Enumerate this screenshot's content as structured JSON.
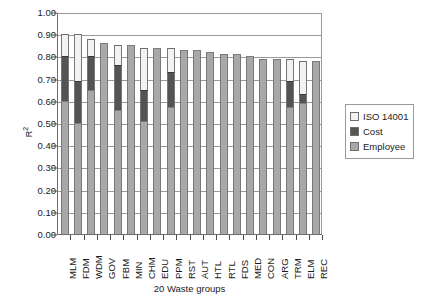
{
  "chart_data": {
    "type": "bar",
    "subtype": "stacked",
    "title": "",
    "xlabel": "20 Waste groups",
    "ylabel": "R²",
    "ylim": [
      0.0,
      1.0
    ],
    "ytick_step": 0.1,
    "grid": true,
    "legend_position": "right",
    "ytick_labels": [
      "1.00",
      "0.90",
      "0.80",
      "0.70",
      "0.60",
      "0.50",
      "0.40",
      "0.30",
      "0.20",
      "0.10",
      "0.00"
    ],
    "ytick_values": [
      1.0,
      0.9,
      0.8,
      0.7,
      0.6,
      0.5,
      0.4,
      0.3,
      0.2,
      0.1,
      0.0
    ],
    "categories": [
      "MLM",
      "FDM",
      "WDM",
      "GOV",
      "FBM",
      "MIN",
      "CHM",
      "EDU",
      "PPM",
      "RST",
      "AUT",
      "HTL",
      "RTL",
      "FDS",
      "MED",
      "CON",
      "ARG",
      "TRM",
      "ELM",
      "REC"
    ],
    "series": [
      {
        "name": "Employee",
        "color": "#a8a8a8",
        "values": [
          0.6,
          0.5,
          0.65,
          0.86,
          0.56,
          0.85,
          0.51,
          0.84,
          0.57,
          0.83,
          0.83,
          0.82,
          0.81,
          0.81,
          0.8,
          0.79,
          0.79,
          0.57,
          0.59,
          0.78
        ]
      },
      {
        "name": "Cost",
        "color": "#545454",
        "values": [
          0.8,
          0.69,
          0.8,
          0.86,
          0.76,
          0.85,
          0.65,
          0.84,
          0.73,
          0.83,
          0.83,
          0.82,
          0.81,
          0.81,
          0.8,
          0.79,
          0.79,
          0.69,
          0.63,
          0.78
        ]
      },
      {
        "name": "ISO 14001",
        "color": "#f2f2f2",
        "values": [
          0.9,
          0.9,
          0.88,
          0.86,
          0.85,
          0.85,
          0.84,
          0.84,
          0.84,
          0.83,
          0.83,
          0.82,
          0.81,
          0.81,
          0.8,
          0.79,
          0.79,
          0.79,
          0.78,
          0.78
        ]
      }
    ],
    "bar_tops": [
      0.9,
      0.9,
      0.88,
      0.86,
      0.85,
      0.85,
      0.84,
      0.84,
      0.84,
      0.83,
      0.83,
      0.82,
      0.81,
      0.81,
      0.8,
      0.79,
      0.79,
      0.79,
      0.78,
      0.78
    ]
  },
  "legend": {
    "items": [
      {
        "label": "ISO 14001",
        "color": "#f2f2f2"
      },
      {
        "label": "Cost",
        "color": "#545454"
      },
      {
        "label": "Employee",
        "color": "#a8a8a8"
      }
    ]
  }
}
